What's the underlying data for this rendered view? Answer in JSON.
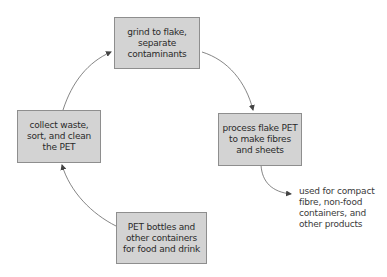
{
  "diagram": {
    "type": "cycle",
    "nodes": [
      {
        "id": "grind",
        "label": "grind to flake,\nseparate contaminants"
      },
      {
        "id": "process",
        "label": "process flake PET\nto make fibres\nand sheets"
      },
      {
        "id": "bottles",
        "label": "PET bottles and\nother containers\nfor food and drink"
      },
      {
        "id": "collect",
        "label": "collect waste,\nsort, and clean\nthe PET"
      }
    ],
    "edges": [
      {
        "from": "collect",
        "to": "grind"
      },
      {
        "from": "grind",
        "to": "process"
      },
      {
        "from": "bottles",
        "to": "collect"
      },
      {
        "from": "process",
        "to": "output_note"
      }
    ],
    "output_note": "used for compact\nfibre, non-food\ncontainers, and\nother products",
    "colors": {
      "box_fill": "#d3d3d3",
      "box_border": "#8e8e8e",
      "arrow": "#555555",
      "text": "#2a2a2a"
    }
  }
}
